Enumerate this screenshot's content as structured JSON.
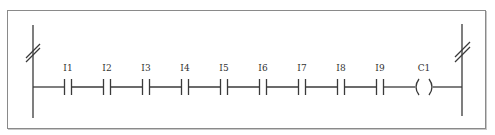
{
  "diagram": {
    "type": "ladder-logic",
    "colors": {
      "line": "#3a3a3a",
      "border": "#8a8a8a",
      "background": "#ffffff"
    },
    "rung": {
      "contacts": [
        {
          "label": "I1",
          "x": 68
        },
        {
          "label": "I2",
          "x": 107
        },
        {
          "label": "I3",
          "x": 146
        },
        {
          "label": "I4",
          "x": 185
        },
        {
          "label": "I5",
          "x": 224
        },
        {
          "label": "I6",
          "x": 263
        },
        {
          "label": "I7",
          "x": 302
        },
        {
          "label": "I8",
          "x": 341
        },
        {
          "label": "I9",
          "x": 380
        }
      ],
      "coil": {
        "label": "C1",
        "x": 424
      }
    }
  }
}
